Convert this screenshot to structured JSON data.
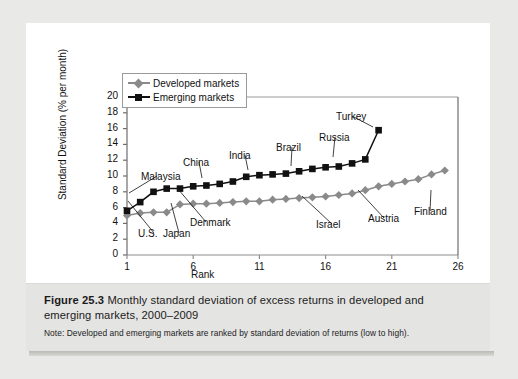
{
  "figure": {
    "number": "Figure 25.3",
    "title": "Monthly standard deviation of excess returns in developed and emerging markets, 2000–2009",
    "note": "Note: Developed and emerging markets are ranked by standard deviation of returns (low to high)."
  },
  "chart_data": {
    "type": "line",
    "title": "",
    "xlabel": "Rank",
    "ylabel": "Standard Deviation (% per month)",
    "xlim": [
      1,
      26
    ],
    "ylim": [
      0,
      20
    ],
    "xticks": [
      1,
      6,
      11,
      16,
      21,
      26
    ],
    "yticks": [
      0,
      2,
      4,
      6,
      8,
      10,
      12,
      14,
      16,
      18,
      20
    ],
    "grid": false,
    "legend_position": "top-left-inside",
    "series": [
      {
        "name": "Developed markets",
        "color": "#8a8a8a",
        "marker": "diamond",
        "x": [
          1,
          2,
          3,
          4,
          5,
          6,
          7,
          8,
          9,
          10,
          11,
          12,
          13,
          14,
          15,
          16,
          17,
          18,
          19,
          20,
          21,
          22,
          23,
          24,
          25
        ],
        "values": [
          5.0,
          5.3,
          5.4,
          5.4,
          6.4,
          6.5,
          6.5,
          6.6,
          6.7,
          6.8,
          6.8,
          7.0,
          7.1,
          7.2,
          7.3,
          7.4,
          7.6,
          7.8,
          8.2,
          8.7,
          9.0,
          9.3,
          9.6,
          10.2,
          10.7
        ]
      },
      {
        "name": "Emerging markets",
        "color": "#111111",
        "marker": "square",
        "x": [
          1,
          2,
          3,
          4,
          5,
          6,
          7,
          8,
          9,
          10,
          11,
          12,
          13,
          14,
          15,
          16,
          17,
          18,
          19,
          20
        ],
        "values": [
          5.6,
          6.7,
          8.0,
          8.4,
          8.4,
          8.7,
          8.8,
          9.0,
          9.3,
          9.9,
          10.1,
          10.2,
          10.3,
          10.6,
          10.9,
          11.1,
          11.2,
          11.6,
          12.1,
          15.8
        ]
      }
    ],
    "annotations": [
      {
        "label": "Malaysia",
        "x": 115,
        "y": 148,
        "tx": 103,
        "ty": 170
      },
      {
        "label": "U.S.",
        "x": 112,
        "y": 205,
        "tx": 102,
        "ty": 178
      },
      {
        "label": "Japan",
        "x": 137,
        "y": 205,
        "tx": 145,
        "ty": 180
      },
      {
        "label": "Denmark",
        "x": 164,
        "y": 194,
        "tx": 152,
        "ty": 166
      },
      {
        "label": "China",
        "x": 157,
        "y": 134,
        "tx": 176,
        "ty": 155
      },
      {
        "label": "India",
        "x": 203,
        "y": 127,
        "tx": 222,
        "ty": 147
      },
      {
        "label": "Brazil",
        "x": 250,
        "y": 119,
        "tx": 265,
        "ty": 143
      },
      {
        "label": "Russia",
        "x": 293,
        "y": 109,
        "tx": 307,
        "ty": 134
      },
      {
        "label": "Turkey",
        "x": 310,
        "y": 88,
        "tx": 347,
        "ty": 104
      },
      {
        "label": "Israel",
        "x": 290,
        "y": 196,
        "tx": 276,
        "ty": 173
      },
      {
        "label": "Austria",
        "x": 342,
        "y": 190,
        "tx": 332,
        "ty": 167
      },
      {
        "label": "Finland",
        "x": 388,
        "y": 183,
        "tx": 405,
        "ty": 167
      }
    ]
  }
}
